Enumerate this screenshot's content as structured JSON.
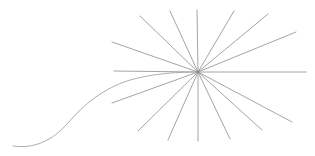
{
  "figure": {
    "background_color": "#ffffff",
    "width": 315,
    "height": 156,
    "line_color": "#9a9a9a",
    "curve_color": "#a3a3a3",
    "line_width": 0.9
  },
  "starburst": {
    "name": "radial-starburst",
    "center_x": 198,
    "center_y": 72,
    "spoke_count": 16,
    "description": "sixteen straight rays radiating from a common hub point",
    "spokes": [
      {
        "id": "spoke-right",
        "x1": 198,
        "y1": 72,
        "x2": 306,
        "y2": 72,
        "angle_deg": 0
      },
      {
        "id": "spoke-right-up-shallow",
        "x1": 198,
        "y1": 72,
        "x2": 296,
        "y2": 32,
        "angle_deg": 22
      },
      {
        "id": "spoke-right-up-mid",
        "x1": 198,
        "y1": 72,
        "x2": 268,
        "y2": 14,
        "angle_deg": 40
      },
      {
        "id": "spoke-right-up-steep",
        "x1": 198,
        "y1": 72,
        "x2": 234,
        "y2": 11,
        "angle_deg": 59
      },
      {
        "id": "spoke-up",
        "x1": 198,
        "y1": 72,
        "x2": 197,
        "y2": 10,
        "angle_deg": 90
      },
      {
        "id": "spoke-left-up-steep",
        "x1": 198,
        "y1": 72,
        "x2": 170,
        "y2": 11,
        "angle_deg": 115
      },
      {
        "id": "spoke-left-up-mid",
        "x1": 198,
        "y1": 72,
        "x2": 140,
        "y2": 16,
        "angle_deg": 136
      },
      {
        "id": "spoke-left-up-shallow",
        "x1": 198,
        "y1": 72,
        "x2": 112,
        "y2": 42,
        "angle_deg": 161
      },
      {
        "id": "spoke-left",
        "x1": 198,
        "y1": 72,
        "x2": 114,
        "y2": 71,
        "angle_deg": 180
      },
      {
        "id": "spoke-left-down-shallow",
        "x1": 198,
        "y1": 72,
        "x2": 112,
        "y2": 103,
        "angle_deg": 200
      },
      {
        "id": "spoke-left-down-mid",
        "x1": 198,
        "y1": 72,
        "x2": 138,
        "y2": 131,
        "angle_deg": 225
      },
      {
        "id": "spoke-left-down-steep",
        "x1": 198,
        "y1": 72,
        "x2": 168,
        "y2": 140,
        "angle_deg": 246
      },
      {
        "id": "spoke-down",
        "x1": 198,
        "y1": 72,
        "x2": 198,
        "y2": 141,
        "angle_deg": 270
      },
      {
        "id": "spoke-right-down-steep",
        "x1": 198,
        "y1": 72,
        "x2": 230,
        "y2": 139,
        "angle_deg": 295
      },
      {
        "id": "spoke-right-down-mid",
        "x1": 198,
        "y1": 72,
        "x2": 262,
        "y2": 130,
        "angle_deg": 316
      },
      {
        "id": "spoke-right-down-shallow",
        "x1": 198,
        "y1": 72,
        "x2": 292,
        "y2": 122,
        "angle_deg": 338
      }
    ]
  },
  "curve": {
    "name": "s-curve-tail",
    "description": "long flattened S-shaped curve entering the hub from the lower left",
    "path": "M 13 146 C 34 149 52 141 68 123 C 84 104 104 88 130 80 C 155 73 180 72 198 72",
    "start_x": 13,
    "start_y": 146,
    "end_x": 198,
    "end_y": 72
  },
  "hub": {
    "name": "convergence-point",
    "x": 198,
    "y": 72,
    "radius": 1.4
  }
}
